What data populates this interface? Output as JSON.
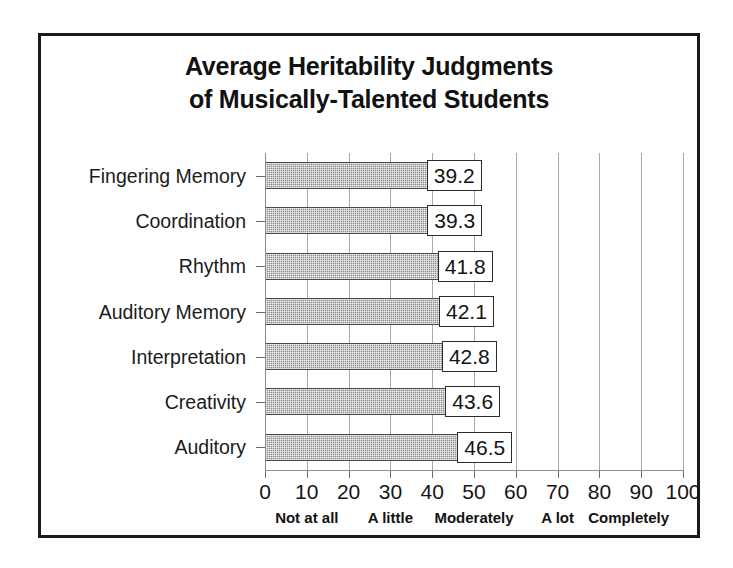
{
  "chart_data": {
    "type": "bar",
    "orientation": "horizontal",
    "title": "Average Heritability Judgments of Musically-Talented Students",
    "title_lines": [
      "Average Heritability Judgments",
      "of Musically-Talented Students"
    ],
    "categories": [
      "Fingering Memory",
      "Coordination",
      "Rhythm",
      "Auditory Memory",
      "Interpretation",
      "Creativity",
      "Auditory"
    ],
    "values": [
      39.2,
      39.3,
      41.8,
      42.1,
      42.8,
      43.6,
      46.5
    ],
    "value_labels": [
      "39.2",
      "39.3",
      "41.8",
      "42.1",
      "42.8",
      "43.6",
      "46.5"
    ],
    "xlabel": "",
    "ylabel": "",
    "xlim": [
      0,
      100
    ],
    "xticks": [
      0,
      10,
      20,
      30,
      40,
      50,
      60,
      70,
      80,
      90,
      100
    ],
    "xtick_labels": [
      "0",
      "10",
      "20",
      "30",
      "40",
      "50",
      "60",
      "70",
      "80",
      "90",
      "100"
    ],
    "grid": true,
    "grid_axis": "x",
    "legend": false,
    "anchors": [
      {
        "label": "Not at all",
        "value": 10
      },
      {
        "label": "A little",
        "value": 30
      },
      {
        "label": "Moderately",
        "value": 50
      },
      {
        "label": "A lot",
        "value": 70
      },
      {
        "label": "Completely",
        "value": 87
      }
    ],
    "colors": {
      "bar_fill": "#8d8d8d",
      "bar_border": "#4a4a4a",
      "gridline": "#a8a8a8",
      "axis": "#8a8a8a",
      "text": "#151515",
      "frame": "#1a1a1a",
      "background": "#ffffff",
      "label_box_fill": "#ffffff",
      "label_box_border": "#2b2b2b"
    }
  }
}
